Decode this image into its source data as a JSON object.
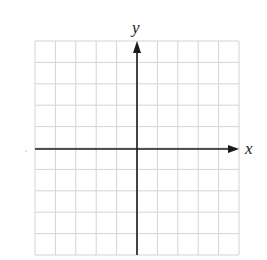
{
  "diagram": {
    "type": "coordinate-grid",
    "x_axis_label": "x",
    "y_axis_label": "y",
    "grid": {
      "columns": 10,
      "rows": 10,
      "left": 35,
      "top": 41,
      "right": 239,
      "bottom": 255,
      "line_color": "#d4d4d4"
    },
    "axes": {
      "x_axis_y": 149,
      "y_axis_x": 137,
      "color": "#1a1a1a"
    }
  }
}
